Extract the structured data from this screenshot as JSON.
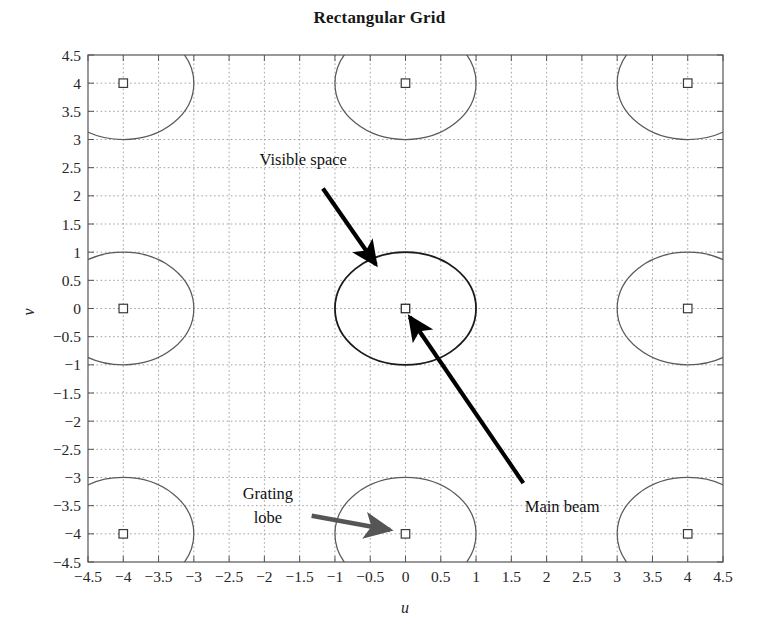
{
  "chart_data": {
    "type": "scatter",
    "title": "Rectangular Grid",
    "xlabel": "u",
    "ylabel": "v",
    "xlim": [
      -4.5,
      4.5
    ],
    "ylim": [
      -4.5,
      4.5
    ],
    "grid": true,
    "grid_style": "dotted",
    "grid_color": "#999999",
    "legend": "none",
    "xticks": [
      -4.5,
      -4,
      -3.5,
      -3,
      -2.5,
      -2,
      -1.5,
      -1,
      -0.5,
      0,
      0.5,
      1,
      1.5,
      2,
      2.5,
      3,
      3.5,
      4,
      4.5
    ],
    "yticks": [
      4.5,
      4,
      3.5,
      3,
      2.5,
      2,
      1.5,
      1,
      0.5,
      0,
      -0.5,
      -1,
      -1.5,
      -2,
      -2.5,
      -3,
      -3.5,
      -4,
      -4.5
    ],
    "xtick_labels": [
      "-4.5",
      "-4",
      "-3.5",
      "-3",
      "-2.5",
      "-2",
      "-1.5",
      "-1",
      "-0.5",
      "0",
      "0.5",
      "1",
      "1.5",
      "2",
      "2.5",
      "3",
      "3.5",
      "4",
      "4.5"
    ],
    "ytick_labels": [
      "4.5",
      "4",
      "3.5",
      "3",
      "2.5",
      "2",
      "1.5",
      "1",
      "0.5",
      "0",
      "-0.5",
      "-1",
      "-1.5",
      "-2",
      "-2.5",
      "-3",
      "-3.5",
      "-4",
      "-4.5"
    ],
    "marker_symbol": "square",
    "markers": [
      {
        "u": -4,
        "v": 4,
        "role": "grating-lobe"
      },
      {
        "u": 0,
        "v": 4,
        "role": "grating-lobe"
      },
      {
        "u": 4,
        "v": 4,
        "role": "grating-lobe"
      },
      {
        "u": -4,
        "v": 0,
        "role": "grating-lobe"
      },
      {
        "u": 0,
        "v": 0,
        "role": "main-beam"
      },
      {
        "u": 4,
        "v": 0,
        "role": "grating-lobe"
      },
      {
        "u": -4,
        "v": -4,
        "role": "grating-lobe"
      },
      {
        "u": 0,
        "v": -4,
        "role": "grating-lobe"
      },
      {
        "u": 4,
        "v": -4,
        "role": "grating-lobe"
      }
    ],
    "circles": [
      {
        "cu": -4,
        "cv": 4,
        "r": 1,
        "role": "grating-lobe-circle"
      },
      {
        "cu": 0,
        "cv": 4,
        "r": 1,
        "role": "grating-lobe-circle"
      },
      {
        "cu": 4,
        "cv": 4,
        "r": 1,
        "role": "grating-lobe-circle"
      },
      {
        "cu": -4,
        "cv": 0,
        "r": 1,
        "role": "grating-lobe-circle"
      },
      {
        "cu": 0,
        "cv": 0,
        "r": 1,
        "role": "visible-space-circle"
      },
      {
        "cu": 4,
        "cv": 0,
        "r": 1,
        "role": "grating-lobe-circle"
      },
      {
        "cu": -4,
        "cv": -4,
        "r": 1,
        "role": "grating-lobe-circle"
      },
      {
        "cu": 0,
        "cv": -4,
        "r": 1,
        "role": "grating-lobe-circle"
      },
      {
        "cu": 4,
        "cv": -4,
        "r": 1,
        "role": "grating-lobe-circle"
      }
    ],
    "annotations": [
      {
        "id": "visible-space",
        "text": "Visible space",
        "text_u": -1.45,
        "text_v": 2.55,
        "tip_u": -0.42,
        "tip_v": 0.78,
        "color": "#000000"
      },
      {
        "id": "main-beam",
        "text": "Main beam",
        "text_u": 2.22,
        "text_v": -3.62,
        "tip_u": 0.06,
        "tip_v": -0.15,
        "color": "#000000"
      },
      {
        "id": "grating-lobe",
        "text_line1": "Grating",
        "text_line2": "lobe",
        "text_u": -1.95,
        "text_v": -3.38,
        "tip_u": -0.22,
        "tip_v": -3.93,
        "color": "#555555"
      }
    ]
  },
  "annotations": {
    "visible_space": "Visible space",
    "main_beam": "Main beam",
    "grating_lobe_line1": "Grating",
    "grating_lobe_line2": "lobe"
  },
  "axis": {
    "x_name": "u",
    "y_name": "v"
  },
  "title": "Rectangular Grid",
  "colors": {
    "axis": "#555555",
    "grid": "#999999",
    "circle": "#5a5a5a",
    "visible_circle": "#1a1a1a",
    "annotation_black": "#000000",
    "annotation_gray": "#555555",
    "text": "#262626",
    "background": "#ffffff"
  }
}
